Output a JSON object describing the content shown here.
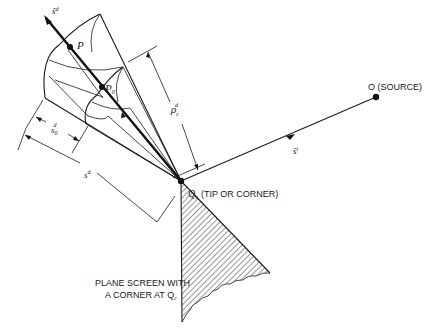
{
  "figure": {
    "type": "diffraction-geometry-diagram",
    "labels": {
      "diffracted_dir": "ŝ",
      "diffracted_dir_sup": "d",
      "point_p": "P",
      "point_p0": "P",
      "point_p0_sub": "0",
      "rho": "ρ",
      "rho_sub": "c",
      "rho_sup": "d",
      "s0": "s",
      "s0_sub": "0",
      "s0_sup": "d",
      "s": "s",
      "s_sup": "d",
      "incident_dir": "ŝ",
      "incident_dir_sup": "i",
      "source": "O (SOURCE)",
      "corner_q": "Q",
      "corner_q_sub": "c",
      "corner_caption": "(TIP OR CORNER)",
      "screen_line1": "PLANE SCREEN WITH",
      "screen_line2": "A CORNER AT Q",
      "screen_line2_sub": "c"
    },
    "colors": {
      "ink": "#1a1a1a",
      "background": "#ffffff"
    }
  }
}
